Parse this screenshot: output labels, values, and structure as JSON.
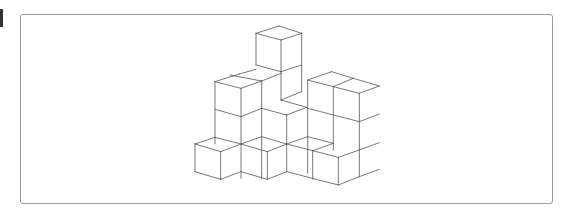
{
  "figure": {
    "line_color": "#555555",
    "frame_border_color": "#9a9a9a"
  }
}
